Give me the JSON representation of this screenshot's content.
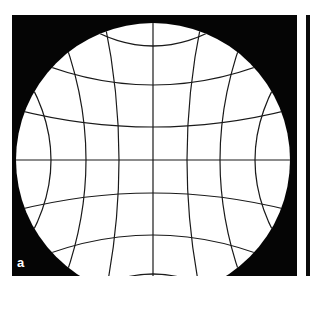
{
  "figure": {
    "panel_label": "a",
    "colors": {
      "background": "#050505",
      "field": "#ffffff",
      "grid_lines": "#1a1a1a"
    },
    "geometry": {
      "circle_center": [
        153,
        160
      ],
      "circle_radius": 137,
      "grid_spacing_center": 34,
      "vertical_line_x_at_center": [
        51,
        86,
        119,
        153,
        187,
        220,
        255
      ],
      "horizontal_line_y_at_center": [
        58,
        93,
        126,
        160,
        193,
        227,
        262
      ]
    }
  }
}
